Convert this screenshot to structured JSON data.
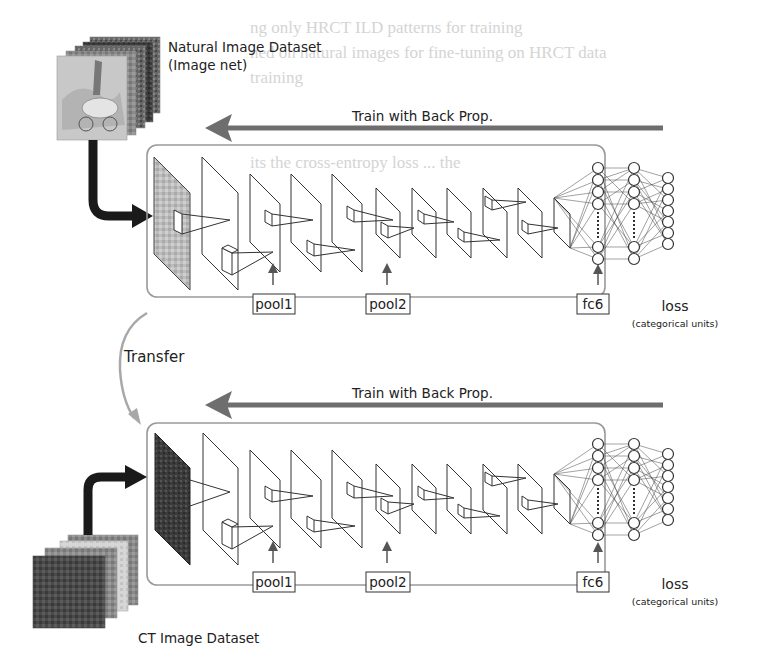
{
  "figure": {
    "top_dataset_label_line1": "Natural Image Dataset",
    "top_dataset_label_line2": "(Image net)",
    "bottom_dataset_label": "CT Image Dataset",
    "top_backprop_label": "Train with Back Prop.",
    "bottom_backprop_label": "Train with Back Prop.",
    "transfer_label": "Transfer",
    "top_network": {
      "pool1_label": "pool1",
      "pool2_label": "pool2",
      "fc6_label": "fc6",
      "loss_label": "loss",
      "loss_sublabel": "(categorical units)"
    },
    "bottom_network": {
      "pool1_label": "pool1",
      "pool2_label": "pool2",
      "fc6_label": "fc6",
      "loss_label": "loss",
      "loss_sublabel": "(categorical units)"
    },
    "colors": {
      "box_stroke": "#9a9a9a",
      "backprop_arrow": "#6e6e6e",
      "transfer_arrow": "#a8a8a8",
      "input_arrow": "#1a1a1a",
      "layer_stroke": "#333333"
    }
  },
  "background_bleed_text": [
    "ng only HRCT ILD patterns for training",
    "ned on natural images for fine-tuning on HRCT data",
    "training",
    "its the cross-entropy loss ... the"
  ]
}
